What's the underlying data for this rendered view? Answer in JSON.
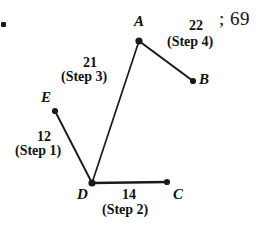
{
  "figure": {
    "type": "weighted-graph-edge-sequence",
    "background_color": "#ffffff",
    "ink_color": "#1a1a1a",
    "vertices": [
      {
        "id": "A",
        "label": "A",
        "x": 139,
        "y": 41,
        "label_x": 134,
        "label_y": 14
      },
      {
        "id": "B",
        "label": "B",
        "x": 193,
        "y": 81,
        "label_x": 199,
        "label_y": 72
      },
      {
        "id": "C",
        "label": "C",
        "x": 167,
        "y": 182,
        "label_x": 173,
        "label_y": 187
      },
      {
        "id": "D",
        "label": "D",
        "x": 92,
        "y": 183,
        "label_x": 77,
        "label_y": 187
      },
      {
        "id": "E",
        "label": "E",
        "x": 55,
        "y": 111,
        "label_x": 41,
        "label_y": 90
      }
    ],
    "edges": [
      {
        "from": "E",
        "to": "D",
        "weight": "12",
        "step": "(Step 1)",
        "weight_x": 37,
        "weight_y": 130,
        "step_x": 15,
        "step_y": 144
      },
      {
        "from": "D",
        "to": "C",
        "weight": "14",
        "step": "(Step 2)",
        "weight_x": 122,
        "weight_y": 188,
        "step_x": 102,
        "step_y": 203
      },
      {
        "from": "D",
        "to": "A",
        "weight": "21",
        "step": "(Step 3)",
        "weight_x": 83,
        "weight_y": 56,
        "step_x": 61,
        "step_y": 70
      },
      {
        "from": "A",
        "to": "B",
        "weight": "22",
        "step": "(Step 4)",
        "weight_x": 189,
        "weight_y": 19,
        "step_x": 167,
        "step_y": 35
      }
    ],
    "annotations": {
      "corner_mark": "bullet-mark",
      "trailing_text": "; 69",
      "trailing_text_x": 219,
      "trailing_text_y": 9
    }
  }
}
